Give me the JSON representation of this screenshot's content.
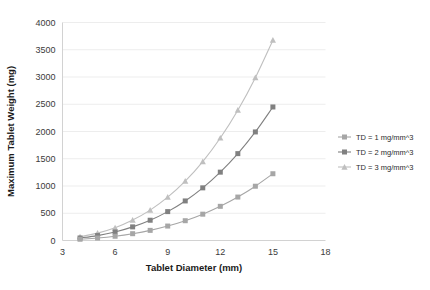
{
  "chart_data": {
    "type": "line",
    "title": "",
    "xlabel": "Tablet Diameter (mm)",
    "ylabel": "Maximum Tablet Weight (mg)",
    "xlim": [
      3,
      18
    ],
    "ylim": [
      0,
      4000
    ],
    "xticks": [
      3,
      6,
      9,
      12,
      15,
      18
    ],
    "yticks": [
      0,
      500,
      1000,
      1500,
      2000,
      2500,
      3000,
      3500,
      4000
    ],
    "grid": "horizontal",
    "legend_position": "right",
    "x": [
      4,
      5,
      6,
      7,
      8,
      9,
      10,
      11,
      12,
      13,
      14,
      15
    ],
    "series": [
      {
        "name": "TD = 1 mg/mm^3",
        "marker": "square",
        "color": "#a6a6a6",
        "values": [
          23,
          45,
          78,
          125,
          186,
          265,
          363,
          483,
          627,
          797,
          996,
          1225
        ]
      },
      {
        "name": "TD = 2 mg/mm^3",
        "marker": "square",
        "color": "#808080",
        "values": [
          46,
          90,
          156,
          250,
          372,
          530,
          726,
          966,
          1254,
          1594,
          1992,
          2450
        ]
      },
      {
        "name": "TD = 3 mg/mm^3",
        "marker": "triangle",
        "color": "#bfbfbf",
        "values": [
          69,
          135,
          234,
          375,
          558,
          795,
          1089,
          1449,
          1881,
          2391,
          2988,
          3675
        ]
      }
    ]
  },
  "axes": {
    "x_title": "Tablet Diameter (mm)",
    "y_title": "Maximum Tablet Weight (mg)",
    "x_tick_labels": [
      "3",
      "6",
      "9",
      "12",
      "15",
      "18"
    ],
    "y_tick_labels": [
      "0",
      "500",
      "1000",
      "1500",
      "2000",
      "2500",
      "3000",
      "3500",
      "4000"
    ]
  },
  "legend": {
    "items": [
      {
        "label": "TD = 1 mg/mm^3",
        "color": "#a6a6a6",
        "marker": "square"
      },
      {
        "label": "TD = 2 mg/mm^3",
        "color": "#808080",
        "marker": "square"
      },
      {
        "label": "TD = 3 mg/mm^3",
        "color": "#bfbfbf",
        "marker": "triangle"
      }
    ]
  }
}
